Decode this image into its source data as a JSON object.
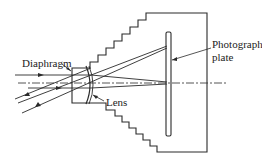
{
  "diagram": {
    "type": "camera-optics-schematic",
    "labels": {
      "diaphragm": "Diaphragm",
      "photographic_plate_line1": "Photographic",
      "photographic_plate_line2": "plate",
      "lens": "Lens"
    },
    "colors": {
      "stroke": "#2a2a2a",
      "background": "#ffffff"
    },
    "components": [
      "bellows-body",
      "diaphragm",
      "lens",
      "photographic-plate",
      "optical-axis",
      "light-rays"
    ]
  }
}
